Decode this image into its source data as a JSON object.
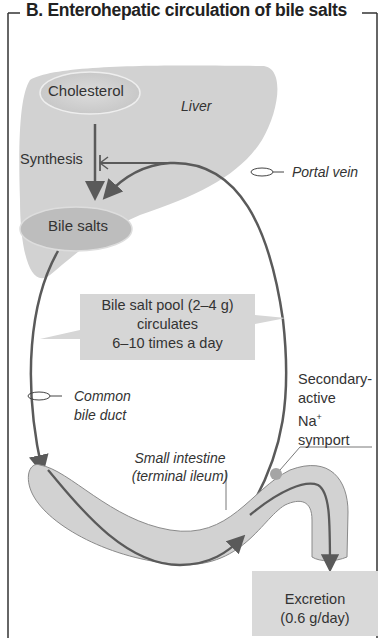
{
  "title": "B.  Enterohepatic circulation of bile salts",
  "labels": {
    "cholesterol": "Cholesterol",
    "liver": "Liver",
    "synthesis": "Synthesis",
    "bile_salts": "Bile salts",
    "portal_vein": "Portal vein",
    "pool_line1": "Bile salt pool (2–4 g)",
    "pool_line2": "circulates",
    "pool_line3": "6–10 times a day",
    "common_bile_duct_1": "Common",
    "common_bile_duct_2": "bile duct",
    "symport_1": "Secondary-",
    "symport_2": "active",
    "symport_3": "Na",
    "symport_sup": "+",
    "symport_4": "symport",
    "small_intestine_1": "Small intestine",
    "small_intestine_2": "(terminal ileum)",
    "excretion_1": "Excretion",
    "excretion_2": "(0.6 g/day)"
  },
  "colors": {
    "organ_fill": "#d4d4d4",
    "arrow": "#5a5a5a",
    "box_fill": "#d9d9d9",
    "symport_dot": "#a0a0a0"
  }
}
